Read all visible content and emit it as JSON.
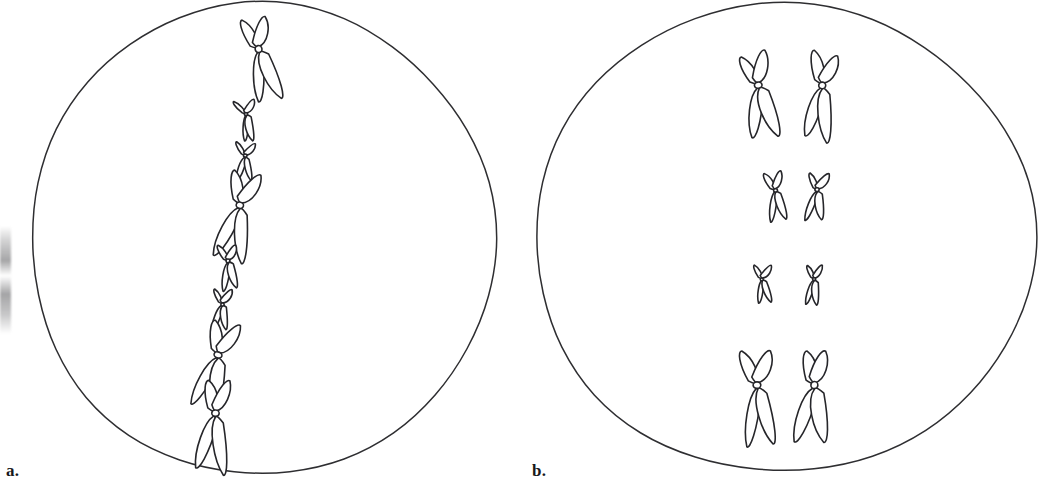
{
  "figure": {
    "width": 1052,
    "height": 489,
    "background_color": "#ffffff",
    "line_color": "#26262a"
  },
  "panels": [
    {
      "id": "a",
      "label": "a.",
      "stage_name": "metaphase of mitosis",
      "cell": {
        "shape": "oval",
        "center_x": 262,
        "center_y": 239,
        "radius_x": 232,
        "radius_y": 236,
        "outline_color": "#2e2e31"
      },
      "arrangement": "single file along equator",
      "chromosome_count": 8,
      "chromosomes": [
        {
          "index": 1,
          "x": 258,
          "y": 49,
          "scale": 1.0,
          "rotation": -12,
          "size": "large",
          "arm_ratio": 0.55
        },
        {
          "index": 2,
          "x": 246,
          "y": 114,
          "scale": 0.48,
          "rotation": -8,
          "size": "small",
          "arm_ratio": 0.5
        },
        {
          "index": 3,
          "x": 245,
          "y": 156,
          "scale": 0.45,
          "rotation": 4,
          "size": "small",
          "arm_ratio": 0.5
        },
        {
          "index": 4,
          "x": 240,
          "y": 205,
          "scale": 1.05,
          "rotation": 14,
          "size": "large",
          "arm_ratio": 0.52
        },
        {
          "index": 5,
          "x": 228,
          "y": 261,
          "scale": 0.52,
          "rotation": -6,
          "size": "small",
          "arm_ratio": 0.5
        },
        {
          "index": 6,
          "x": 222,
          "y": 304,
          "scale": 0.48,
          "rotation": 2,
          "size": "small",
          "arm_ratio": 0.5
        },
        {
          "index": 7,
          "x": 218,
          "y": 355,
          "scale": 1.02,
          "rotation": 18,
          "size": "large",
          "arm_ratio": 0.48
        },
        {
          "index": 8,
          "x": 215,
          "y": 413,
          "scale": 1.0,
          "rotation": 6,
          "size": "large",
          "arm_ratio": 0.45
        }
      ]
    },
    {
      "id": "b",
      "label": "b.",
      "stage_name": "metaphase I of meiosis",
      "cell": {
        "shape": "oval",
        "center_x": 258,
        "center_y": 238,
        "radius_x": 250,
        "radius_y": 234,
        "outline_color": "#2e2e31"
      },
      "arrangement": "homologous pairs side by side along equator",
      "chromosome_count": 8,
      "pair_count": 4,
      "pairs": [
        {
          "index": 1,
          "size": "large",
          "y": 85,
          "left": {
            "x": 232,
            "scale": 1.0,
            "rotation": -8
          },
          "right": {
            "x": 296,
            "scale": 1.0,
            "rotation": 8
          }
        },
        {
          "index": 2,
          "size": "medium",
          "y": 190,
          "left": {
            "x": 249,
            "scale": 0.56,
            "rotation": -6
          },
          "right": {
            "x": 291,
            "scale": 0.56,
            "rotation": 6
          }
        },
        {
          "index": 3,
          "size": "small",
          "y": 279,
          "left": {
            "x": 236,
            "scale": 0.45,
            "rotation": -4
          },
          "right": {
            "x": 288,
            "scale": 0.45,
            "rotation": 4
          }
        },
        {
          "index": 4,
          "size": "large",
          "y": 385,
          "left": {
            "x": 231,
            "scale": 1.06,
            "rotation": -4
          },
          "right": {
            "x": 288,
            "scale": 1.06,
            "rotation": 4
          }
        }
      ]
    }
  ],
  "artifact": {
    "name": "scan-edge-smudge",
    "present": true,
    "description": "grey photocopy shadow on far left edge"
  }
}
